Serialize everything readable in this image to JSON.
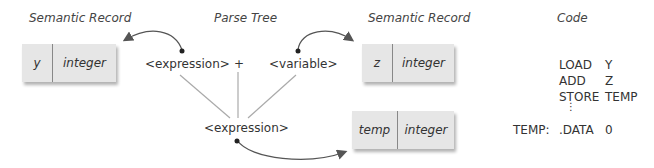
{
  "headings": {
    "left_record": "Semantic Record",
    "parse_tree": "Parse Tree",
    "right_record": "Semantic Record",
    "code": "Code"
  },
  "parse_tree": {
    "left_child": "<expression>",
    "operator": "+",
    "right_child": "<variable>",
    "root": "<expression>"
  },
  "records": [
    {
      "name": "y",
      "type": "integer"
    },
    {
      "name": "z",
      "type": "integer"
    },
    {
      "name": "temp",
      "type": "integer"
    }
  ],
  "code": {
    "lines": [
      {
        "label": "",
        "op": "LOAD",
        "arg": "Y"
      },
      {
        "label": "",
        "op": "ADD",
        "arg": "Z"
      },
      {
        "label": "",
        "op": "STORE",
        "arg": "TEMP"
      },
      {
        "label": "TEMP:",
        "op": ".DATA",
        "arg": "0"
      }
    ],
    "ellipsis": "⋮"
  },
  "colors": {
    "record_fill": "#e6e6e6",
    "line": "#aaaaaa",
    "arrow": "#555555"
  }
}
